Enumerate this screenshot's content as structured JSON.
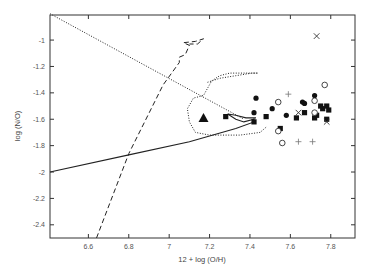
{
  "chart_data": {
    "type": "scatter",
    "title": "",
    "xlabel": "12 + log (O/H)",
    "ylabel": "log (N/O)",
    "xlim": [
      6.41,
      7.92
    ],
    "ylim": [
      -2.5,
      -0.81
    ],
    "xticks": [
      6.6,
      6.8,
      7,
      7.2,
      7.4,
      7.6,
      7.8
    ],
    "xtick_labels": [
      "6.6",
      "6.8",
      "7",
      "7.2",
      "7.4",
      "7.6",
      "7.8"
    ],
    "yticks": [
      -1,
      -1.2,
      -1.4,
      -1.6,
      -1.8,
      -2,
      -2.2,
      -2.4
    ],
    "ytick_labels": [
      "-1",
      "-1.2",
      "-1.4",
      "-1.6",
      "-1.8",
      "-2",
      "-2.2",
      "-2.4"
    ],
    "grid": false,
    "legend": "none",
    "series": [
      {
        "name": "filled circles",
        "marker": "circle-filled",
        "points": [
          [
            7.43,
            -1.44
          ],
          [
            7.42,
            -1.55
          ],
          [
            7.51,
            -1.52
          ],
          [
            7.58,
            -1.57
          ],
          [
            7.66,
            -1.47
          ],
          [
            7.67,
            -1.48
          ],
          [
            7.72,
            -1.42
          ]
        ]
      },
      {
        "name": "filled squares",
        "marker": "square-filled",
        "points": [
          [
            7.28,
            -1.58
          ],
          [
            7.42,
            -1.62
          ],
          [
            7.48,
            -1.58
          ],
          [
            7.55,
            -1.67
          ],
          [
            7.63,
            -1.59
          ],
          [
            7.67,
            -1.55
          ],
          [
            7.72,
            -1.59
          ],
          [
            7.73,
            -1.57
          ],
          [
            7.76,
            -1.52
          ],
          [
            7.78,
            -1.5
          ],
          [
            7.79,
            -1.53
          ],
          [
            7.78,
            -1.6
          ],
          [
            7.75,
            -1.5
          ]
        ]
      },
      {
        "name": "open circles",
        "marker": "circle-open",
        "points": [
          [
            7.54,
            -1.47
          ],
          [
            7.72,
            -1.46
          ],
          [
            7.77,
            -1.34
          ],
          [
            7.72,
            -1.55
          ],
          [
            7.54,
            -1.69
          ],
          [
            7.56,
            -1.78
          ]
        ]
      },
      {
        "name": "crosses",
        "marker": "x",
        "points": [
          [
            7.73,
            -0.97
          ],
          [
            7.64,
            -1.55
          ],
          [
            7.78,
            -1.62
          ]
        ]
      },
      {
        "name": "plus",
        "marker": "plus",
        "points": [
          [
            7.59,
            -1.41
          ],
          [
            7.64,
            -1.77
          ],
          [
            7.71,
            -1.77
          ]
        ]
      },
      {
        "name": "triangle",
        "marker": "triangle-filled",
        "points": [
          [
            7.17,
            -1.59
          ]
        ]
      }
    ],
    "curves": [
      {
        "name": "dotted diagonal",
        "style": "dotted",
        "points": [
          [
            6.41,
            -0.8
          ],
          [
            7.37,
            -1.6
          ]
        ]
      },
      {
        "name": "dashed track",
        "style": "dashed",
        "points": [
          [
            6.64,
            -2.5
          ],
          [
            6.8,
            -1.86
          ],
          [
            6.97,
            -1.34
          ],
          [
            7.05,
            -1.17
          ],
          [
            7.05,
            -1.13
          ],
          [
            7.08,
            -1.11
          ],
          [
            7.1,
            -1.04
          ],
          [
            7.07,
            -1.02
          ],
          [
            7.13,
            -1.01
          ],
          [
            7.17,
            -0.99
          ],
          [
            7.14,
            -1.03
          ],
          [
            7.1,
            -1.03
          ]
        ]
      },
      {
        "name": "dotted envelope",
        "style": "dotted",
        "points": [
          [
            7.19,
            -1.32
          ],
          [
            7.25,
            -1.29
          ],
          [
            7.33,
            -1.27
          ],
          [
            7.41,
            -1.25
          ],
          [
            7.44,
            -1.25
          ],
          [
            7.3,
            -1.25
          ],
          [
            7.25,
            -1.27
          ],
          [
            7.21,
            -1.31
          ],
          [
            7.17,
            -1.42
          ],
          [
            7.12,
            -1.44
          ],
          [
            7.09,
            -1.52
          ],
          [
            7.1,
            -1.62
          ],
          [
            7.13,
            -1.7
          ],
          [
            7.2,
            -1.72
          ],
          [
            7.35,
            -1.72
          ],
          [
            7.45,
            -1.7
          ],
          [
            7.48,
            -1.66
          ]
        ]
      },
      {
        "name": "solid track",
        "style": "solid",
        "points": [
          [
            6.41,
            -2.0
          ],
          [
            6.8,
            -1.87
          ],
          [
            7.1,
            -1.77
          ],
          [
            7.33,
            -1.67
          ],
          [
            7.42,
            -1.62
          ],
          [
            7.42,
            -1.6
          ],
          [
            7.37,
            -1.62
          ],
          [
            7.33,
            -1.6
          ],
          [
            7.29,
            -1.56
          ],
          [
            7.33,
            -1.57
          ],
          [
            7.38,
            -1.59
          ],
          [
            7.43,
            -1.59
          ]
        ]
      }
    ]
  }
}
